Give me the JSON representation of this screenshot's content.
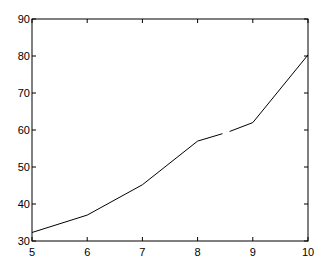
{
  "chart_data": {
    "type": "line",
    "title": "",
    "xlabel": "",
    "ylabel": "",
    "xlim": [
      5,
      10
    ],
    "ylim": [
      30,
      90
    ],
    "grid": false,
    "legend": null,
    "x_ticks": [
      5,
      6,
      7,
      8,
      9,
      10
    ],
    "y_ticks": [
      30,
      40,
      50,
      60,
      70,
      80,
      90
    ],
    "series": [
      {
        "name": "series-1",
        "color": "#000000",
        "segments": [
          {
            "x": [
              5,
              6,
              7,
              8,
              8.45
            ],
            "y": [
              32.3,
              37,
              45.2,
              57,
              59
            ]
          },
          {
            "x": [
              8.58,
              9,
              10
            ],
            "y": [
              59.6,
              62,
              80.3
            ]
          }
        ]
      }
    ]
  }
}
